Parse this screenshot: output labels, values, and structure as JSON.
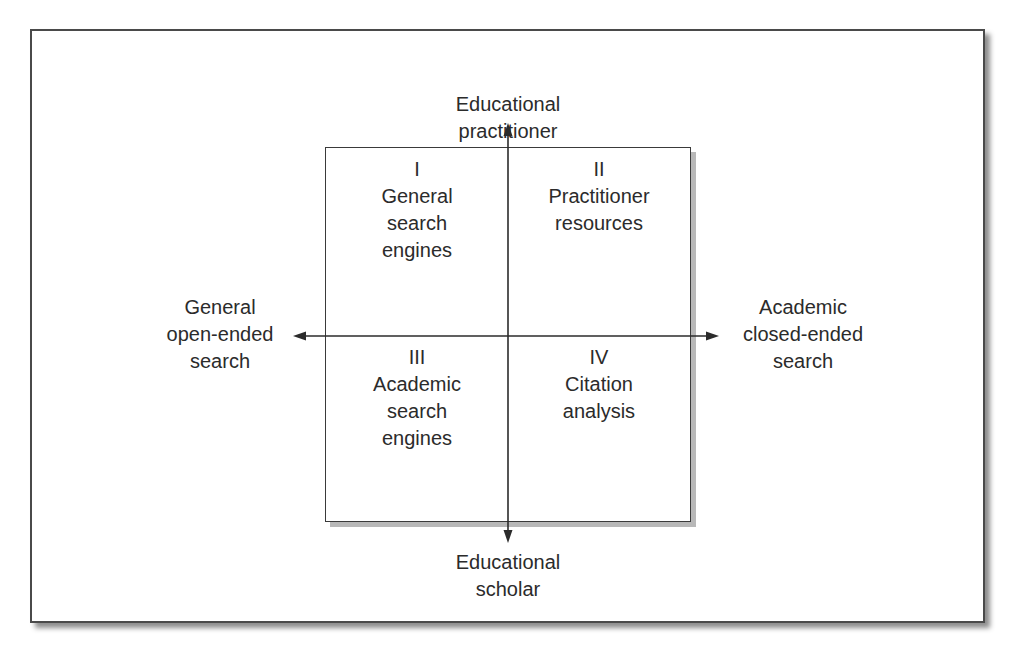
{
  "diagram": {
    "type": "quadrant",
    "axes": {
      "top": "Educational\npractitioner",
      "bottom": "Educational\nscholar",
      "left": "General\nopen-ended\nsearch",
      "right": "Academic\nclosed-ended\nsearch"
    },
    "quadrants": [
      {
        "numeral": "I",
        "label": "General\nsearch\nengines"
      },
      {
        "numeral": "II",
        "label": "Practitioner\nresources"
      },
      {
        "numeral": "III",
        "label": "Academic\nsearch\nengines"
      },
      {
        "numeral": "IV",
        "label": "Citation\nanalysis"
      }
    ],
    "colors": {
      "line": "#2b2b2b",
      "text": "#2b2b2b",
      "background": "#ffffff"
    }
  }
}
